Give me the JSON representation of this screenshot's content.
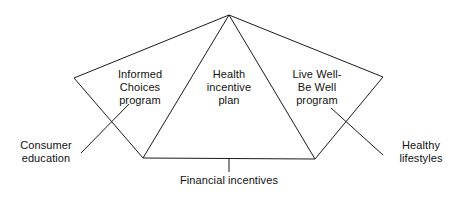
{
  "diagram": {
    "type": "fan-pentagon-concept-diagram",
    "line_color": "#1b1b1b",
    "background_color": "#ffffff",
    "text_color": "#111111",
    "inner_labels": [
      {
        "id": "informed-choices",
        "text": "Informed\nChoices\nprogram",
        "lines": [
          "Informed",
          "Choices",
          "program"
        ]
      },
      {
        "id": "health-incentive-plan",
        "text": "Health\nincentive\nplan",
        "lines": [
          "Health",
          "incentive",
          "plan"
        ]
      },
      {
        "id": "live-well-be-well",
        "text": "Live Well-\nBe Well\nprogram",
        "lines": [
          "Live Well-",
          "Be Well",
          "program"
        ]
      }
    ],
    "callout_labels": [
      {
        "id": "consumer-education",
        "text": "Consumer\neducation",
        "lines": [
          "Consumer",
          "education"
        ],
        "position": "left"
      },
      {
        "id": "healthy-lifestyles",
        "text": "Healthy\nlifestyles",
        "lines": [
          "Healthy",
          "lifestyles"
        ],
        "position": "right"
      },
      {
        "id": "financial-incentives",
        "text": "Financial incentives",
        "lines": [
          "Financial incentives"
        ],
        "position": "bottom"
      }
    ],
    "vertices": {
      "apex": [
        229,
        15
      ],
      "left": [
        74,
        78
      ],
      "right": [
        383,
        77
      ],
      "bottom_left": [
        143,
        158
      ],
      "bottom_right": [
        315,
        159
      ]
    }
  }
}
